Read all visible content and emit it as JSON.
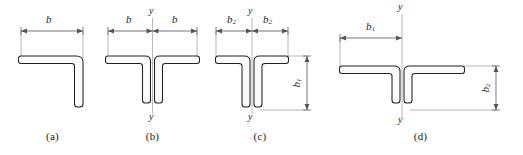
{
  "diagram": {
    "stroke_color": "#222222",
    "dim_color": "#555555",
    "background": "#ffffff",
    "figures": [
      {
        "id": "a",
        "caption": "(a)",
        "section_type": "single-angle",
        "labels": {
          "width_top": "b",
          "width_top_sub": "",
          "axis_top": "",
          "axis_bottom": "",
          "height_right": "",
          "height_right_sub": "",
          "width_left": "",
          "width_left_sub": ""
        }
      },
      {
        "id": "b",
        "caption": "(b)",
        "section_type": "double-angle-tee",
        "labels": {
          "width_left": "b",
          "width_left_sub": "",
          "width_right": "b",
          "width_right_sub": "",
          "axis_top": "y",
          "axis_bottom": "y",
          "height_right": "",
          "height_right_sub": ""
        }
      },
      {
        "id": "c",
        "caption": "(c)",
        "section_type": "double-angle-tee-long-leg",
        "labels": {
          "width_left": "b",
          "width_left_sub": "2",
          "width_right": "b",
          "width_right_sub": "2",
          "axis_top": "y",
          "axis_bottom": "y",
          "height_right": "b",
          "height_right_sub": "1"
        }
      },
      {
        "id": "d",
        "caption": "(d)",
        "section_type": "double-angle-tee-wide-flange",
        "labels": {
          "width_left": "b",
          "width_left_sub": "1",
          "width_right": "",
          "width_right_sub": "",
          "axis_top": "y",
          "axis_bottom": "y",
          "height_right": "b",
          "height_right_sub": "2"
        }
      }
    ]
  }
}
